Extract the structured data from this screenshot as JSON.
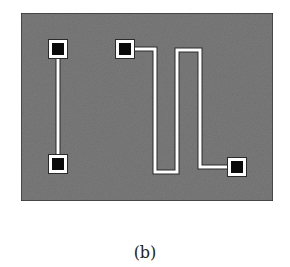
{
  "figure": {
    "caption": "(b)",
    "colors": {
      "substrate": "#7a7a7a",
      "substrate_border": "#2a2a2a",
      "trace": "#ffffff",
      "trace_outline": "#2a2a2a",
      "pad_fill": "#0a0a0a",
      "pad_ring": "#ffffff"
    },
    "elements": [
      {
        "name": "straight-resistor",
        "description": "straight conductor line between two pads"
      },
      {
        "name": "meander-resistor",
        "description": "serpentine conductor line between two pads"
      }
    ]
  }
}
